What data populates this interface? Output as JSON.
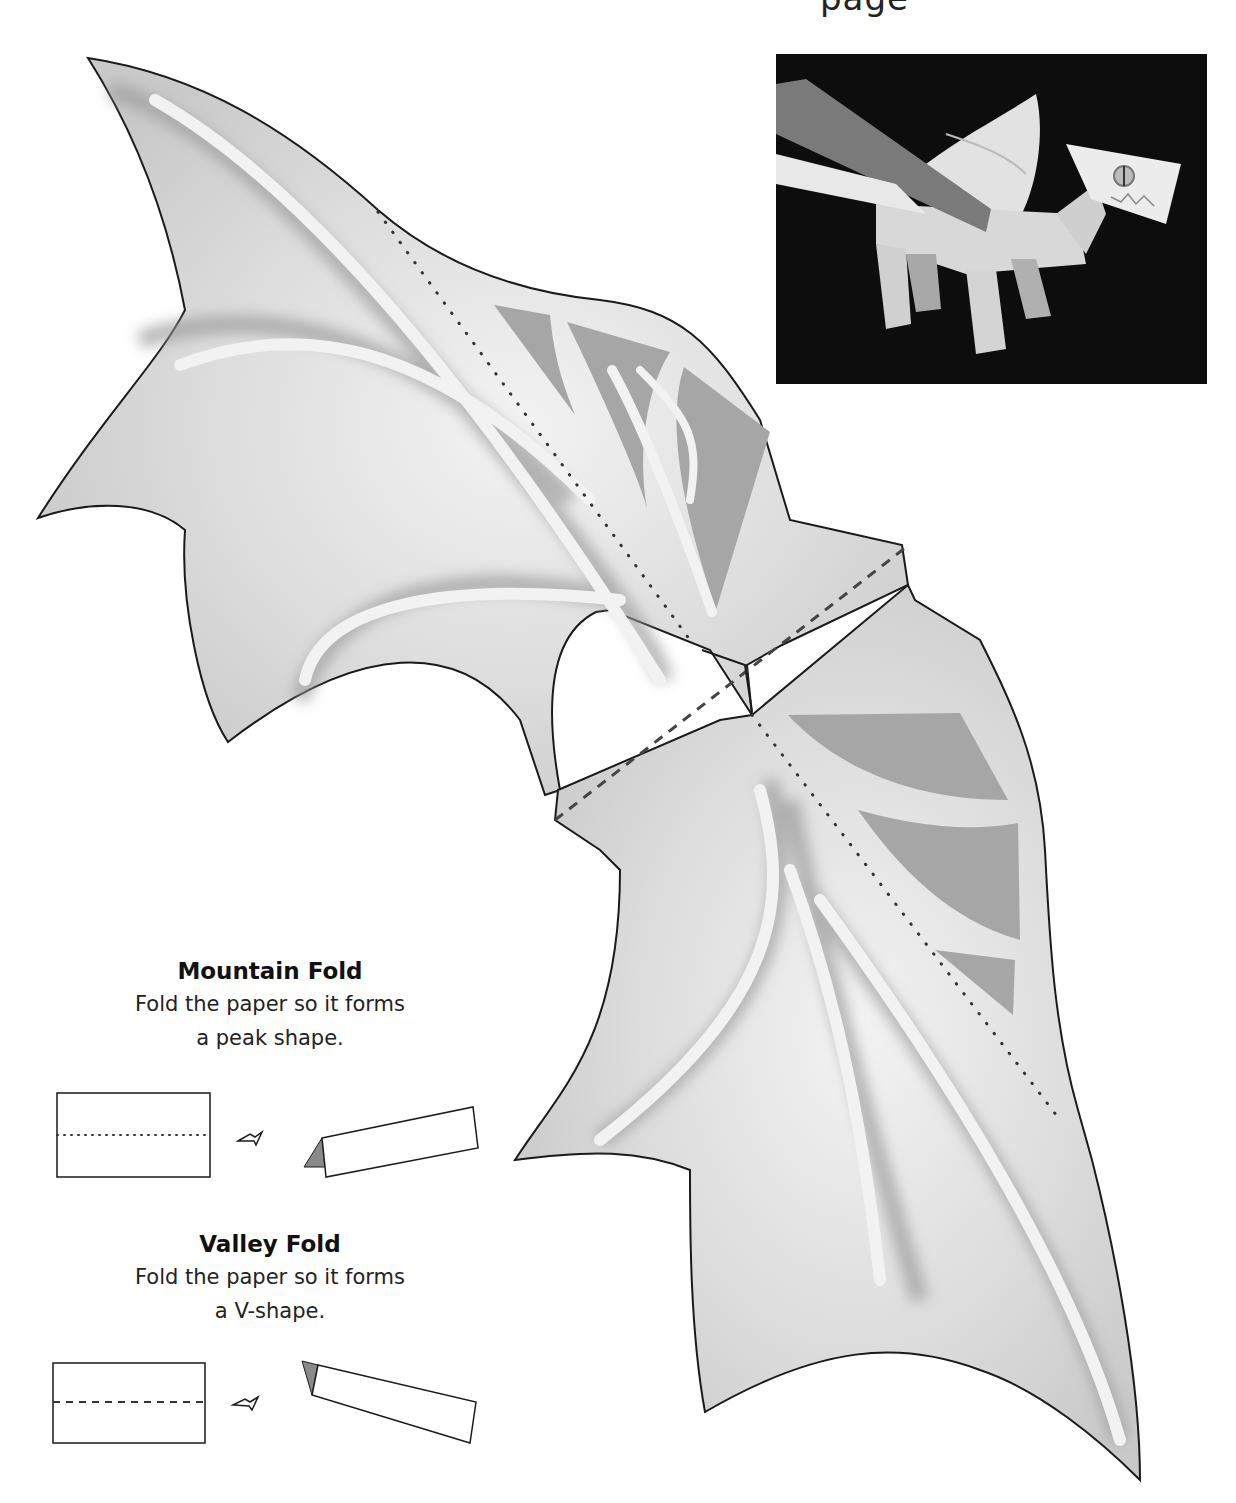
{
  "page": {
    "header_fragment": "page"
  },
  "photo": {
    "alt": "Finished paper dragon model photographed on black background"
  },
  "wing_template": {
    "fold_lines": {
      "mountain": "dotted",
      "valley": "dashed"
    },
    "colors": {
      "paper": "#d4d4d4",
      "paper_light": "#ececec",
      "membrane_panel": "#a6a6a6",
      "bone_strip": "#f2f2f2",
      "outline": "#1a1a1a"
    }
  },
  "legend": {
    "mountain": {
      "title": "Mountain Fold",
      "line1": "Fold the paper so it forms",
      "line2": "a peak shape."
    },
    "valley": {
      "title": "Valley Fold",
      "line1": "Fold the paper so it forms",
      "line2": "a V-shape."
    }
  }
}
